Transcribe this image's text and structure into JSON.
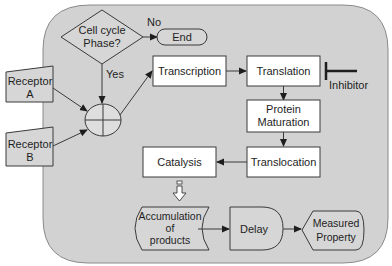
{
  "diagram": {
    "colors": {
      "background": "#ffffff",
      "cell_region": "#d2d2d2",
      "box_fill": "#ffffff",
      "shape_fill": "#d6d6d6",
      "stroke": "#3a3a3a"
    },
    "decision": {
      "line1": "Cell cycle",
      "line2": "Phase?"
    },
    "no_label": "No",
    "yes_label": "Yes",
    "end": "End",
    "receptor_a": {
      "line1": "Receptor",
      "line2": "A"
    },
    "receptor_b": {
      "line1": "Receptor",
      "line2": "B"
    },
    "transcription": "Transcription",
    "translation": "Translation",
    "inhibitor": "Inhibitor",
    "protein_maturation": {
      "line1": "Protein",
      "line2": "Maturation"
    },
    "translocation": "Translocation",
    "catalysis": "Catalysis",
    "accumulation": {
      "line1": "Accumulation",
      "line2": "of",
      "line3": "products"
    },
    "delay": "Delay",
    "measured_property": {
      "line1": "Measured",
      "line2": "Property"
    }
  }
}
